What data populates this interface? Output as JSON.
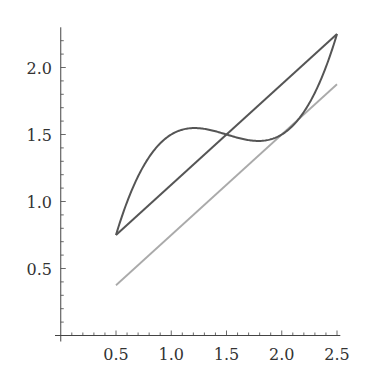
{
  "chart_data": {
    "type": "line",
    "title": "",
    "xlabel": "",
    "ylabel": "",
    "xlim": [
      0,
      2.5
    ],
    "ylim": [
      0,
      2.3
    ],
    "grid": false,
    "legend": null,
    "x_ticks": [
      "0.5",
      "1.0",
      "1.5",
      "2.0",
      "2.5"
    ],
    "y_ticks": [
      "0.5",
      "1.0",
      "1.5",
      "2.0"
    ],
    "series": [
      {
        "name": "cubic",
        "color": "#555555",
        "description": "y = 0.75x + 0.375 + (x-0.5)(x-1.5)(x-2.5), x in [0.5, 2.5]",
        "x": [
          0.5,
          0.6,
          0.7,
          0.8,
          0.9,
          1.0,
          1.1,
          1.2,
          1.3,
          1.4,
          1.5,
          1.6,
          1.7,
          1.8,
          1.9,
          2.0,
          2.1,
          2.2,
          2.3,
          2.4,
          2.5
        ],
        "values": [
          0.75,
          1.017,
          1.227,
          1.386,
          1.495,
          1.5,
          1.574,
          1.548,
          1.532,
          1.521,
          1.5,
          1.479,
          1.468,
          1.452,
          1.466,
          1.5,
          1.559,
          1.644,
          1.761,
          1.911,
          2.25
        ]
      },
      {
        "name": "secant line",
        "color": "#555555",
        "description": "y = 0.75x + 0.375",
        "x": [
          0.5,
          2.5
        ],
        "values": [
          0.75,
          2.25
        ]
      },
      {
        "name": "tangent line",
        "color": "#aaaaaa",
        "description": "y = 0.75x",
        "x": [
          0.5,
          2.5
        ],
        "values": [
          0.375,
          1.875
        ]
      }
    ]
  }
}
